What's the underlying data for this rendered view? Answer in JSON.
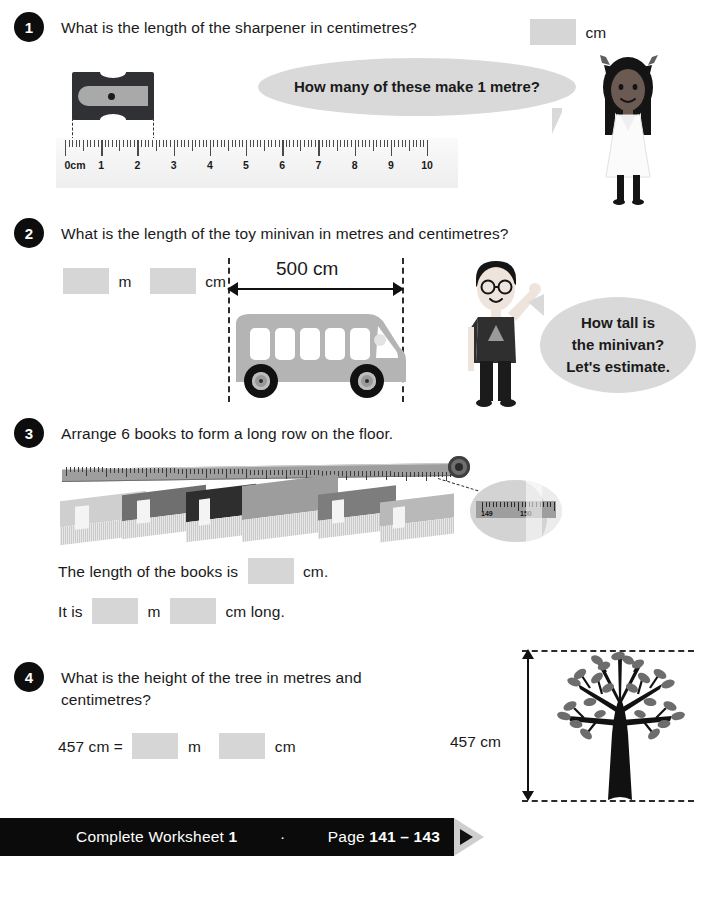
{
  "questions": [
    {
      "number": "1",
      "text": "What is the length of the sharpener in centimetres?",
      "unit_cm": "cm",
      "bubble": "How many of these make 1 metre?",
      "ruler": {
        "labels": [
          "0cm",
          "1",
          "2",
          "3",
          "4",
          "5",
          "6",
          "7",
          "8",
          "9",
          "10"
        ]
      }
    },
    {
      "number": "2",
      "text": "What is the length of the toy minivan in metres and centimetres?",
      "unit_m": "m",
      "unit_cm": "cm",
      "dimension": "500 cm",
      "bubble_lines": [
        "How tall is",
        "the minivan?",
        "Let's estimate."
      ]
    },
    {
      "number": "3",
      "text": "Arrange 6 books to form a long row on the floor.",
      "line1_pre": "The length of the books is",
      "line1_post": "cm.",
      "line2_pre": "It is",
      "line2_mid": "m",
      "line2_post": "cm long.",
      "magnifier": {
        "left_label": "149",
        "right_label": "150"
      }
    },
    {
      "number": "4",
      "text": "What is the height of the tree in metres and centimetres?",
      "equation_pre": "457 cm =",
      "unit_m": "m",
      "unit_cm": "cm",
      "tree_label": "457 cm"
    }
  ],
  "footer": {
    "prefix": "Complete Worksheet",
    "worksheet_number": "1",
    "separator": "·",
    "page_word": "Page",
    "page_range": "141 – 143"
  },
  "colors": {
    "badge": "#0d0d0d",
    "answer_box": "#d6d6d6",
    "bubble": "#d9d9d9",
    "banner": "#0b0b0b",
    "van_body": "#b4b4b4"
  }
}
